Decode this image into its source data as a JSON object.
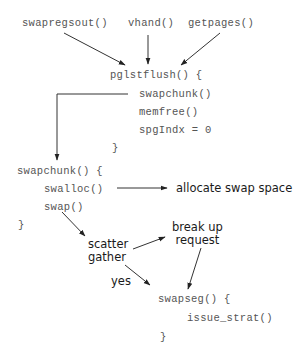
{
  "diagram": {
    "callers": [
      "swapregsout()",
      "vhand()",
      "getpages()"
    ],
    "pglstflush": {
      "header": "pglstflush() {",
      "body": [
        "swapchunk()",
        "memfree()",
        "spgIndx = 0"
      ],
      "close": "}"
    },
    "swapchunk": {
      "header": "swapchunk() {",
      "body": [
        "swalloc()",
        "swap()"
      ],
      "close": "}"
    },
    "annotations": {
      "allocate": "allocate swap space",
      "scatter_gather": "scatter\ngather",
      "break_up": "break up\nrequest",
      "yes": "yes"
    },
    "swapseg": {
      "header": "swapseg() {",
      "body": [
        "issue_strat()"
      ],
      "close": "}"
    },
    "colors": {
      "code_text": "#555555",
      "label_text": "#1a1a1a",
      "arrow": "#222222"
    }
  }
}
